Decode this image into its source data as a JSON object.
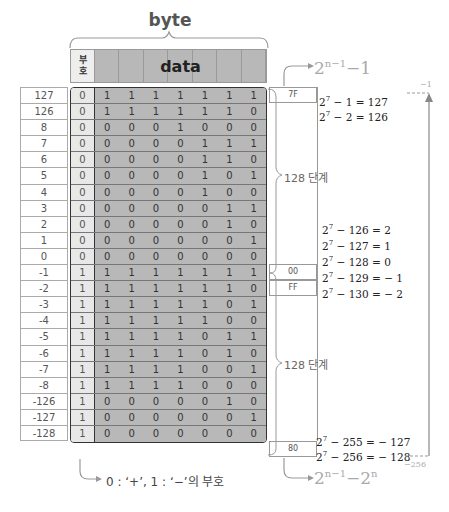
{
  "header": {
    "byte_label": "byte",
    "sign_label_line1": "부",
    "sign_label_line2": "호",
    "data_label": "data"
  },
  "rows": [
    {
      "value": "127",
      "sign": "0",
      "bits": [
        "1",
        "1",
        "1",
        "1",
        "1",
        "1",
        "1"
      ]
    },
    {
      "value": "126",
      "sign": "0",
      "bits": [
        "1",
        "1",
        "1",
        "1",
        "1",
        "1",
        "0"
      ]
    },
    {
      "value": "8",
      "sign": "0",
      "bits": [
        "0",
        "0",
        "0",
        "1",
        "0",
        "0",
        "0"
      ]
    },
    {
      "value": "7",
      "sign": "0",
      "bits": [
        "0",
        "0",
        "0",
        "0",
        "1",
        "1",
        "1"
      ]
    },
    {
      "value": "6",
      "sign": "0",
      "bits": [
        "0",
        "0",
        "0",
        "0",
        "1",
        "1",
        "0"
      ]
    },
    {
      "value": "5",
      "sign": "0",
      "bits": [
        "0",
        "0",
        "0",
        "0",
        "1",
        "0",
        "1"
      ]
    },
    {
      "value": "4",
      "sign": "0",
      "bits": [
        "0",
        "0",
        "0",
        "0",
        "1",
        "0",
        "0"
      ]
    },
    {
      "value": "3",
      "sign": "0",
      "bits": [
        "0",
        "0",
        "0",
        "0",
        "0",
        "1",
        "1"
      ]
    },
    {
      "value": "2",
      "sign": "0",
      "bits": [
        "0",
        "0",
        "0",
        "0",
        "0",
        "1",
        "0"
      ]
    },
    {
      "value": "1",
      "sign": "0",
      "bits": [
        "0",
        "0",
        "0",
        "0",
        "0",
        "0",
        "1"
      ]
    },
    {
      "value": "0",
      "sign": "0",
      "bits": [
        "0",
        "0",
        "0",
        "0",
        "0",
        "0",
        "0"
      ]
    },
    {
      "value": "-1",
      "sign": "1",
      "bits": [
        "1",
        "1",
        "1",
        "1",
        "1",
        "1",
        "1"
      ]
    },
    {
      "value": "-2",
      "sign": "1",
      "bits": [
        "1",
        "1",
        "1",
        "1",
        "1",
        "1",
        "0"
      ]
    },
    {
      "value": "-3",
      "sign": "1",
      "bits": [
        "1",
        "1",
        "1",
        "1",
        "1",
        "0",
        "1"
      ]
    },
    {
      "value": "-4",
      "sign": "1",
      "bits": [
        "1",
        "1",
        "1",
        "1",
        "1",
        "0",
        "0"
      ]
    },
    {
      "value": "-5",
      "sign": "1",
      "bits": [
        "1",
        "1",
        "1",
        "1",
        "0",
        "1",
        "1"
      ]
    },
    {
      "value": "-6",
      "sign": "1",
      "bits": [
        "1",
        "1",
        "1",
        "1",
        "0",
        "1",
        "0"
      ]
    },
    {
      "value": "-7",
      "sign": "1",
      "bits": [
        "1",
        "1",
        "1",
        "1",
        "0",
        "0",
        "1"
      ]
    },
    {
      "value": "-8",
      "sign": "1",
      "bits": [
        "1",
        "1",
        "1",
        "1",
        "0",
        "0",
        "0"
      ]
    },
    {
      "value": "-126",
      "sign": "1",
      "bits": [
        "0",
        "0",
        "0",
        "0",
        "0",
        "1",
        "0"
      ]
    },
    {
      "value": "-127",
      "sign": "1",
      "bits": [
        "0",
        "0",
        "0",
        "0",
        "0",
        "0",
        "1"
      ]
    },
    {
      "value": "-128",
      "sign": "1",
      "bits": [
        "0",
        "0",
        "0",
        "0",
        "0",
        "0",
        "0"
      ]
    }
  ],
  "hex": {
    "h7f": "7F",
    "h00": "00",
    "hff": "FF",
    "h80": "80"
  },
  "steps": {
    "upper": "128 단계",
    "lower": "128 단계"
  },
  "top_formula": {
    "base": "2",
    "exp": "n−1",
    "rest": "−1"
  },
  "bottom_formula": {
    "base": "2",
    "exp": "n−1",
    "mid": "−2",
    "exp2": "n"
  },
  "equations": [
    {
      "lhs": "2",
      "exp": "7",
      "rest": " − 1 = 127"
    },
    {
      "lhs": "2",
      "exp": "7",
      "rest": " − 2 = 126"
    },
    {
      "lhs": "2",
      "exp": "7",
      "rest": " − 126 = 2"
    },
    {
      "lhs": "2",
      "exp": "7",
      "rest": " − 127 = 1"
    },
    {
      "lhs": "2",
      "exp": "7",
      "rest": " − 128 = 0"
    },
    {
      "lhs": "2",
      "exp": "7",
      "rest": " − 129 = − 1"
    },
    {
      "lhs": "2",
      "exp": "7",
      "rest": " − 130 = − 2"
    },
    {
      "lhs": "2",
      "exp": "7",
      "rest": " − 255 = − 127"
    },
    {
      "lhs": "2",
      "exp": "7",
      "rest": " − 256 = − 128"
    }
  ],
  "range_labels": {
    "top": "−1",
    "bottom": "−256"
  },
  "sign_note": "0 : ‘+’, 1 : ‘−’의 부호"
}
